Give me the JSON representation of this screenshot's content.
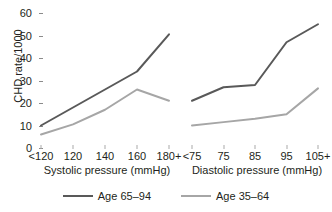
{
  "chart_data": {
    "type": "line",
    "title": "",
    "ylabel": "CHD rate/1000",
    "ylim": [
      0,
      60
    ],
    "yticks": [
      0,
      10,
      20,
      30,
      40,
      50,
      60
    ],
    "grid": false,
    "legend_position": "bottom",
    "panels": [
      {
        "name": "systolic",
        "xlabel": "Systolic pressure (mmHg)",
        "categories": [
          "<120",
          "120",
          "140",
          "160",
          "180+"
        ],
        "series": [
          {
            "name": "Age 65–94",
            "color": "#595959",
            "values": [
              10,
              18,
              26,
              34,
              50.5
            ]
          },
          {
            "name": "Age 35–64",
            "color": "#a6a6a6",
            "values": [
              6,
              10.5,
              17,
              26,
              21
            ]
          }
        ]
      },
      {
        "name": "diastolic",
        "xlabel": "Diastolic pressure (mmHg)",
        "categories": [
          "<75",
          "75",
          "85",
          "95",
          "105+"
        ],
        "series": [
          {
            "name": "Age 65–94",
            "color": "#595959",
            "values": [
              21,
              27,
              28,
              47,
              55
            ]
          },
          {
            "name": "Age 35–64",
            "color": "#a6a6a6",
            "values": [
              10,
              11.5,
              13,
              15,
              26.5
            ]
          }
        ]
      }
    ],
    "legend": [
      {
        "label": "Age 65–94",
        "color": "#595959"
      },
      {
        "label": "Age 35–64",
        "color": "#a6a6a6"
      }
    ]
  }
}
